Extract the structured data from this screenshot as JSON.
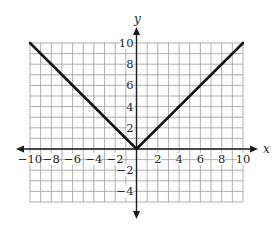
{
  "chart_data": {
    "type": "line",
    "title": "",
    "xlabel": "x",
    "ylabel": "y",
    "xlim": [
      -10,
      10
    ],
    "ylim": [
      -5,
      10
    ],
    "grid": true,
    "x_ticks": [
      -10,
      -8,
      -6,
      -4,
      -2,
      2,
      4,
      6,
      8,
      10
    ],
    "y_ticks": [
      10,
      8,
      6,
      4,
      2,
      -2,
      -4
    ],
    "x_tick_labels": [
      "−10",
      "−8",
      "−6",
      "−4",
      "−2",
      "2",
      "4",
      "6",
      "8",
      "10"
    ],
    "y_tick_labels": [
      "10",
      "8",
      "6",
      "4",
      "2",
      "−2",
      "−4"
    ],
    "series": [
      {
        "name": "y = |x|",
        "x": [
          -10,
          0,
          10
        ],
        "y": [
          10,
          0,
          10
        ],
        "color": "#111111"
      }
    ]
  },
  "labels": {
    "x_axis": "x",
    "y_axis": "y"
  }
}
